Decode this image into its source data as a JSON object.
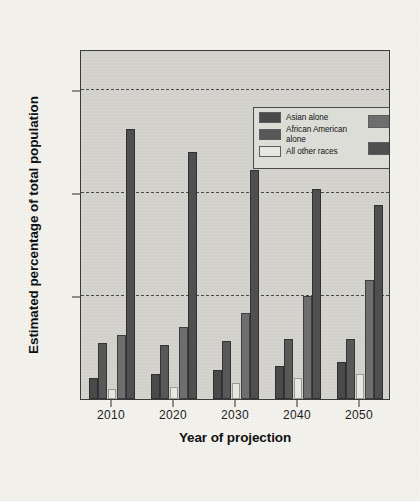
{
  "chart_data": {
    "type": "bar",
    "title": "",
    "xlabel": "Year of projection",
    "ylabel": "Estimated percentage of total population",
    "categories": [
      "2010",
      "2020",
      "2030",
      "2040",
      "2050"
    ],
    "ylim": [
      0,
      85
    ],
    "yticks": [
      25,
      50,
      75
    ],
    "grid": "horizontal dashed gridlines at y ticks",
    "legend_position": "top-center inside plot area",
    "series": [
      {
        "name": "Asian alone",
        "color": "#4a4a4a",
        "values": [
          5,
          6,
          7,
          8,
          9
        ]
      },
      {
        "name": "African American alone",
        "color": "#585858",
        "values": [
          13.5,
          13,
          14,
          14.5,
          14.5
        ]
      },
      {
        "name": "All other races",
        "color": "#e8e7e2",
        "values": [
          2.5,
          3,
          4,
          5,
          6
        ]
      },
      {
        "name": "White alone, Hispanic",
        "color": "#6e6e6e",
        "values": [
          15.5,
          17.5,
          21,
          25,
          29
        ]
      },
      {
        "name": "White alone, non Hispanic",
        "color": "#4f4f4f",
        "values": [
          65.5,
          60,
          55.5,
          51,
          47
        ]
      }
    ]
  },
  "legend": {
    "entries_left": [
      {
        "label": "Asian alone",
        "color": "#4a4a4a"
      },
      {
        "label": "African American alone",
        "color": "#585858"
      },
      {
        "label": "All other races",
        "color": "#e8e7e2"
      }
    ],
    "entries_right": [
      {
        "label": "White alone,\nHispanic",
        "color": "#6e6e6e"
      },
      {
        "label": "White alone,\nnon Hispanic",
        "color": "#4f4f4f"
      }
    ]
  },
  "colors": {
    "plot_background": "#d3d2cd",
    "page_background": "#f3f2ed",
    "axis": "#2a2a2a",
    "gridline": "#4a4a4a"
  }
}
